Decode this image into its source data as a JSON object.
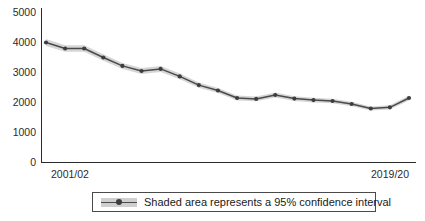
{
  "chart_data": {
    "type": "line",
    "title": "",
    "subtitle": "",
    "xlabel": "",
    "ylabel": "",
    "ylim": [
      0,
      5000
    ],
    "ytick_labels": [
      "5000",
      "4000",
      "3000",
      "2000",
      "1000",
      "0"
    ],
    "yticks": [
      5000,
      4000,
      3000,
      2000,
      1000,
      0
    ],
    "grid": false,
    "legend_position": "bottom-center",
    "legend_entries": [
      "Shaded area represents a 95% confidence interval"
    ],
    "xtick_labels": [
      "2001/02",
      "2019/20"
    ],
    "categories": [
      "2001/02",
      "2002/03",
      "2003/04",
      "2004/05",
      "2005/06",
      "2006/07",
      "2007/08",
      "2008/09",
      "2009/10",
      "2010/11",
      "2011/12",
      "2012/13",
      "2013/14",
      "2014/15",
      "2015/16",
      "2016/17",
      "2017/18",
      "2018/19",
      "2019/20",
      "2020/21"
    ],
    "series": [
      {
        "name": "Estimate",
        "values": [
          4000,
          3800,
          3800,
          3500,
          3220,
          3050,
          3120,
          2870,
          2580,
          2400,
          2150,
          2120,
          2250,
          2130,
          2080,
          2050,
          1950,
          1800,
          1840,
          2150
        ],
        "ci_lower": [
          3880,
          3690,
          3690,
          3395,
          3120,
          2950,
          3020,
          2775,
          2490,
          2315,
          2070,
          2040,
          2165,
          2050,
          2000,
          1975,
          1878,
          1732,
          1770,
          2065
        ],
        "ci_upper": [
          4120,
          3910,
          3910,
          3605,
          3320,
          3150,
          3220,
          2965,
          2670,
          2485,
          2230,
          2200,
          2335,
          2210,
          2160,
          2125,
          2022,
          1868,
          1910,
          2235
        ]
      }
    ],
    "colors": {
      "line": "#4a4a4a",
      "marker": "#3d3d3d",
      "band": "#cfcfcf",
      "axis": "#2b2b2b"
    }
  },
  "legend": {
    "label": "Shaded area represents a 95% confidence interval"
  }
}
